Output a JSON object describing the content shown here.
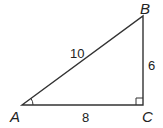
{
  "diagram": {
    "type": "right-triangle",
    "vertices": {
      "A": {
        "label": "A",
        "x": 22,
        "y": 105
      },
      "B": {
        "label": "B",
        "x": 143,
        "y": 16
      },
      "C": {
        "label": "C",
        "x": 143,
        "y": 105
      }
    },
    "sides": {
      "AB": {
        "label": "10"
      },
      "BC": {
        "label": "6"
      },
      "AC": {
        "label": "8"
      }
    },
    "right_angle_at": "C",
    "angle_marked": "A",
    "colors": {
      "stroke": "#333333",
      "text": "#222222"
    }
  }
}
